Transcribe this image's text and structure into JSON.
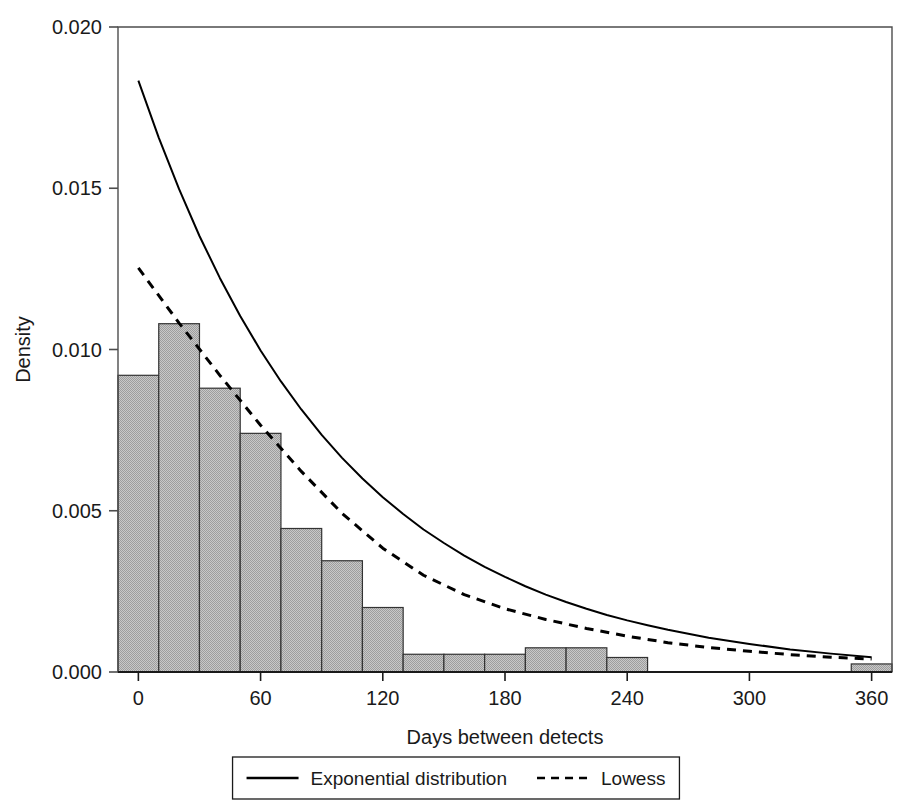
{
  "chart_data": {
    "type": "bar",
    "title": "",
    "xlabel": "Days between detects",
    "ylabel": "Density",
    "xlim": [
      -10,
      370
    ],
    "ylim": [
      0.0,
      0.02
    ],
    "grid": false,
    "legend_position": "bottom-outside",
    "xticks": [
      0,
      60,
      120,
      180,
      240,
      300,
      360
    ],
    "xtick_labels": [
      "0",
      "60",
      "120",
      "180",
      "240",
      "300",
      "360"
    ],
    "yticks": [
      0.0,
      0.005,
      0.01,
      0.015,
      0.02
    ],
    "ytick_labels": [
      "0.000",
      "0.005",
      "0.010",
      "0.015",
      "0.020"
    ],
    "bin_width": 20,
    "bin_starts": [
      -10,
      10,
      30,
      50,
      70,
      90,
      110,
      130,
      150,
      170,
      190,
      210,
      230,
      250,
      270,
      290,
      310,
      330,
      350
    ],
    "categories": [
      "0",
      "20",
      "40",
      "60",
      "80",
      "100",
      "120",
      "140",
      "160",
      "180",
      "200",
      "220",
      "240",
      "260",
      "280",
      "300",
      "320",
      "340",
      "360"
    ],
    "values": [
      0.0092,
      0.0108,
      0.0088,
      0.0074,
      0.00445,
      0.00345,
      0.002,
      0.00055,
      0.00055,
      0.00055,
      0.00075,
      0.00075,
      0.00045,
      0.0,
      0.0,
      0.0,
      0.0,
      0.0,
      0.00025
    ],
    "bar_fill": "#b3b3b3",
    "bar_stroke": "#333333",
    "series": [
      {
        "name": "Exponential distribution",
        "style": "solid",
        "color": "#000000",
        "x": [
          0,
          10,
          20,
          30,
          40,
          50,
          60,
          70,
          80,
          90,
          100,
          110,
          120,
          130,
          140,
          150,
          160,
          170,
          180,
          190,
          200,
          210,
          220,
          230,
          240,
          250,
          260,
          280,
          300,
          320,
          340,
          360
        ],
        "y": [
          0.01834,
          0.01657,
          0.01497,
          0.01352,
          0.01222,
          0.01104,
          0.00997,
          0.00901,
          0.00814,
          0.00735,
          0.00664,
          0.006,
          0.00542,
          0.0049,
          0.00442,
          0.004,
          0.00361,
          0.00326,
          0.00295,
          0.00266,
          0.0024,
          0.00217,
          0.00196,
          0.00177,
          0.0016,
          0.00145,
          0.00131,
          0.00106,
          0.00087,
          0.0007,
          0.00057,
          0.00046
        ]
      },
      {
        "name": "Lowess",
        "style": "dashed",
        "color": "#000000",
        "x": [
          0,
          20,
          40,
          60,
          80,
          100,
          120,
          140,
          160,
          180,
          200,
          220,
          240,
          260,
          280,
          300,
          320,
          340,
          360
        ],
        "y": [
          0.01253,
          0.01082,
          0.0092,
          0.00765,
          0.00622,
          0.00492,
          0.00384,
          0.003,
          0.0024,
          0.00196,
          0.00163,
          0.00135,
          0.00111,
          0.00091,
          0.00076,
          0.00064,
          0.00054,
          0.00046,
          0.0004
        ]
      }
    ],
    "legend": [
      {
        "label": "Exponential distribution",
        "style": "solid"
      },
      {
        "label": "Lowess",
        "style": "dashed"
      }
    ]
  }
}
